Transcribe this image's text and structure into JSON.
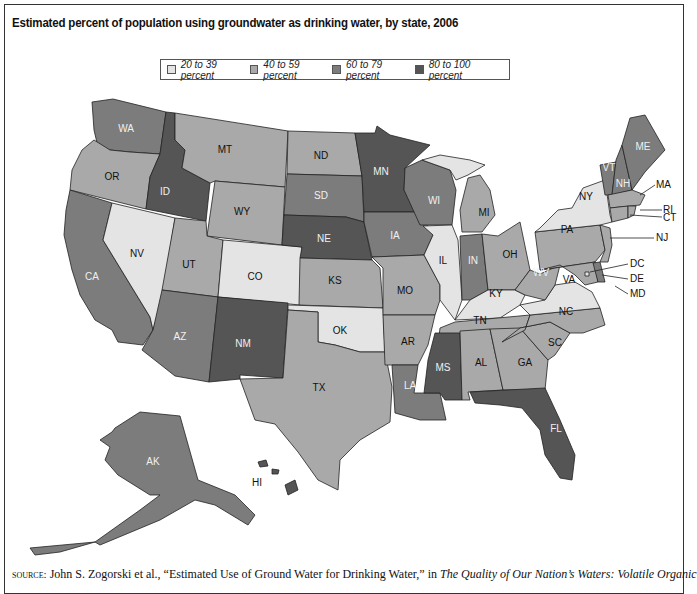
{
  "title": "Estimated percent of population using groundwater as drinking water, by state, 2006",
  "legend": [
    {
      "label": "20 to 39 percent",
      "color": "#e4e4e4"
    },
    {
      "label": "40 to 59 percent",
      "color": "#a9a9a9"
    },
    {
      "label": "60 to 79 percent",
      "color": "#7c7c7c"
    },
    {
      "label": "80 to 100 percent",
      "color": "#555555"
    }
  ],
  "categories": {
    "c1": "20 to 39 percent",
    "c2": "40 to 59 percent",
    "c3": "60 to 79 percent",
    "c4": "80 to 100 percent"
  },
  "states": {
    "WA": "60 to 79 percent",
    "OR": "40 to 59 percent",
    "CA": "60 to 79 percent",
    "ID": "80 to 100 percent",
    "NV": "20 to 39 percent",
    "MT": "40 to 59 percent",
    "WY": "40 to 59 percent",
    "UT": "40 to 59 percent",
    "CO": "20 to 39 percent",
    "AZ": "60 to 79 percent",
    "NM": "80 to 100 percent",
    "ND": "40 to 59 percent",
    "SD": "60 to 79 percent",
    "NE": "80 to 100 percent",
    "KS": "40 to 59 percent",
    "OK": "20 to 39 percent",
    "TX": "40 to 59 percent",
    "MN": "80 to 100 percent",
    "IA": "60 to 79 percent",
    "MO": "40 to 59 percent",
    "AR": "40 to 59 percent",
    "LA": "60 to 79 percent",
    "WI": "60 to 79 percent",
    "IL": "20 to 39 percent",
    "MI": "40 to 59 percent",
    "IN": "60 to 79 percent",
    "OH": "40 to 59 percent",
    "KY": "20 to 39 percent",
    "TN": "40 to 59 percent",
    "MS": "80 to 100 percent",
    "AL": "40 to 59 percent",
    "GA": "40 to 59 percent",
    "FL": "80 to 100 percent",
    "SC": "40 to 59 percent",
    "NC": "40 to 59 percent",
    "VA": "20 to 39 percent",
    "WV": "40 to 59 percent",
    "PA": "40 to 59 percent",
    "NY": "20 to 39 percent",
    "VT": "60 to 79 percent",
    "NH": "60 to 79 percent",
    "ME": "60 to 79 percent",
    "MA": "40 to 59 percent",
    "RI": "40 to 59 percent",
    "CT": "40 to 59 percent",
    "NJ": "40 to 59 percent",
    "DE": "60 to 79 percent",
    "MD": "40 to 59 percent",
    "DC": "20 to 39 percent",
    "AK": "60 to 79 percent",
    "HI": "80 to 100 percent"
  },
  "labels": {
    "WA": "WA",
    "OR": "OR",
    "CA": "CA",
    "ID": "ID",
    "NV": "NV",
    "MT": "MT",
    "WY": "WY",
    "UT": "UT",
    "CO": "CO",
    "AZ": "AZ",
    "NM": "NM",
    "ND": "ND",
    "SD": "SD",
    "NE": "NE",
    "KS": "KS",
    "OK": "OK",
    "TX": "TX",
    "MN": "MN",
    "IA": "IA",
    "MO": "MO",
    "AR": "AR",
    "LA": "LA",
    "WI": "WI",
    "IL": "IL",
    "MI": "MI",
    "IN": "IN",
    "OH": "OH",
    "KY": "KY",
    "TN": "TN",
    "MS": "MS",
    "AL": "AL",
    "GA": "GA",
    "FL": "FL",
    "SC": "SC",
    "NC": "NC",
    "VA": "VA",
    "WV": "WV",
    "PA": "PA",
    "NY": "NY",
    "VT": "VT",
    "NH": "NH",
    "ME": "ME",
    "MA": "MA",
    "RI": "RI",
    "CT": "CT",
    "NJ": "NJ",
    "DE": "DE",
    "MD": "MD",
    "DC": "DC",
    "AK": "AK",
    "HI": "HI"
  },
  "source": {
    "prefix": "source:",
    "text": " John S. Zogorski et al., “Estimated Use of Ground Water for Drinking Water,” in ",
    "italic": "The Quality of Our Nation’s Waters: Volatile Organic"
  }
}
